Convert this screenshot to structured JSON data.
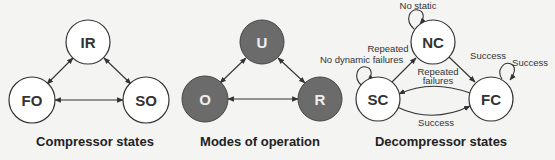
{
  "colors": {
    "background": "#f4f4f3",
    "line": "#333333",
    "light_fill": "#ffffff",
    "dark_fill": "#6b6b6b",
    "dark_text": "#f0f0f0"
  },
  "diagrams": [
    {
      "title": "Compressor states",
      "nodes": [
        {
          "id": "IR",
          "label": "IR"
        },
        {
          "id": "FO",
          "label": "FO"
        },
        {
          "id": "SO",
          "label": "SO"
        }
      ],
      "edges": [
        {
          "from": "IR",
          "to": "FO",
          "bidirectional": true
        },
        {
          "from": "IR",
          "to": "SO",
          "bidirectional": true
        },
        {
          "from": "FO",
          "to": "SO",
          "bidirectional": true
        }
      ]
    },
    {
      "title": "Modes of operation",
      "nodes": [
        {
          "id": "U",
          "label": "U"
        },
        {
          "id": "O",
          "label": "O"
        },
        {
          "id": "R",
          "label": "R"
        }
      ],
      "edges": [
        {
          "from": "U",
          "to": "O",
          "bidirectional": true
        },
        {
          "from": "U",
          "to": "R",
          "bidirectional": true
        },
        {
          "from": "O",
          "to": "R",
          "bidirectional": true
        }
      ]
    },
    {
      "title": "Decompressor states",
      "nodes": [
        {
          "id": "NC",
          "label": "NC"
        },
        {
          "id": "SC",
          "label": "SC"
        },
        {
          "id": "FC",
          "label": "FC"
        }
      ],
      "edges": [
        {
          "from": "NC",
          "to": "NC",
          "label": "No static"
        },
        {
          "from": "SC",
          "to": "SC",
          "label": "No dynamic"
        },
        {
          "from": "FC",
          "to": "FC",
          "label": "Success"
        },
        {
          "from": "SC",
          "to": "NC",
          "label": "Repeated failures"
        },
        {
          "from": "NC",
          "to": "FC",
          "label": "Success"
        },
        {
          "from": "FC",
          "to": "SC",
          "label": "Repeated failures"
        },
        {
          "from": "SC",
          "to": "FC",
          "label": "Success"
        }
      ]
    }
  ],
  "labels": {
    "no_static": "No static",
    "no_dynamic": "No dynamic",
    "repeated_failures_1": "Repeated",
    "repeated_failures_2": "failures",
    "success": "Success"
  }
}
